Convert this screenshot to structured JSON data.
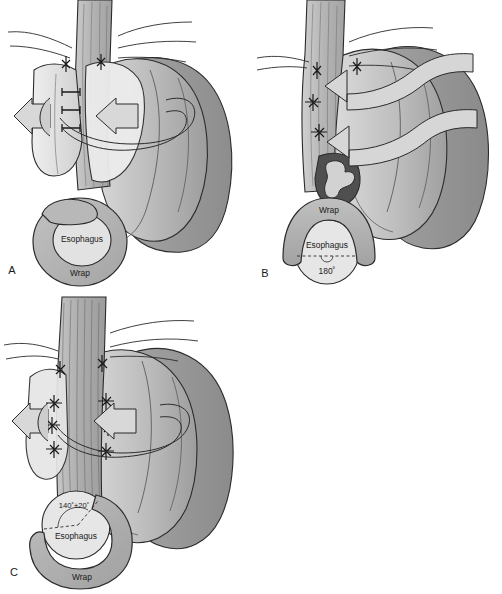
{
  "figure": {
    "background_color": "#ffffff",
    "ink_color": "#1a1a1a",
    "palette": {
      "esophagus_gray": "#b4b4b4",
      "esophagus_light": "#c9c9c9",
      "fundus_mid": "#a9a9a9",
      "fundus_light": "#d7d7d7",
      "fundus_dark": "#8e8e8e",
      "wrap_fill": "#b0b0b0",
      "lumen_light": "#dedede",
      "mucosa_dark": "#5a5a5a",
      "arrow_fill": "#d4d4d4",
      "outline": "#2b2b2b"
    }
  },
  "panels": [
    {
      "id": "A",
      "letter": "A",
      "wrap_type": "complete-360-wrap",
      "degrees": 360,
      "degrees_label": "",
      "arrow_count": 1,
      "arrow_style": "encircling-ribbon",
      "suture_rows": 3,
      "crow_foot_sutures": 2,
      "inset": {
        "shape": "full-ring",
        "esophagus_label": "Esophagus",
        "wrap_label": "Wrap",
        "angle_label": ""
      }
    },
    {
      "id": "B",
      "letter": "B",
      "wrap_type": "posterior-partial-wrap",
      "degrees": 180,
      "degrees_label": "180˚",
      "arrow_count": 2,
      "arrow_style": "s-curved-leftward",
      "suture_rows": 3,
      "crow_foot_sutures": 2,
      "has_mucosal_cutaway": true,
      "inset": {
        "shape": "inverted-u-arc",
        "esophagus_label": "Esophagus",
        "wrap_label": "Wrap",
        "angle_label": "180˚"
      }
    },
    {
      "id": "C",
      "letter": "C",
      "wrap_type": "anterior-partial-wrap",
      "degrees": 140,
      "degrees_tolerance": 20,
      "degrees_label": "140˚±20˚",
      "arrow_count": 1,
      "arrow_style": "encircling-ribbon",
      "suture_rows": 4,
      "suture_columns": 2,
      "inset": {
        "shape": "c-shaped-cuff",
        "esophagus_label": "Esophagus",
        "wrap_label": "Wrap",
        "angle_label": "140˚±20˚"
      }
    }
  ]
}
